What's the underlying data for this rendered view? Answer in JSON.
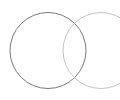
{
  "canvas": {
    "width": 120,
    "height": 100,
    "background": "#ffffff"
  },
  "diagram": {
    "type": "venn-circles",
    "circles": [
      {
        "id": "left-circle",
        "cx": 48,
        "cy": 50.5,
        "r": 38,
        "stroke": "#7a7a7a",
        "stroke_width": 1,
        "fill": "none"
      },
      {
        "id": "right-circle",
        "cx": 101,
        "cy": 50.5,
        "r": 38,
        "stroke": "#c4c4c4",
        "stroke_width": 1,
        "fill": "none"
      }
    ]
  }
}
